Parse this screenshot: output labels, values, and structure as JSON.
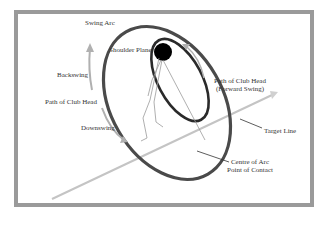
{
  "labels": {
    "swing_arc": "Swing Arc",
    "shoulder_plane": "Shoulder Plane",
    "backswing": "Backswing",
    "path_of_club_head": "Path of Club Head",
    "downswing": "Downswing",
    "path_forward_line1": "Path of Club Head",
    "path_forward_line2": "(Forward Swing)",
    "target_line": "Target Line",
    "centre_line1": "Centre of Arc",
    "centre_line2": "Point of Contact"
  },
  "colors": {
    "frame": "#9a9a9a",
    "arc": "#4a4a4a",
    "inner_ellipse": "#2a2a2a",
    "shoulder": "#000000",
    "arrows": "#b0b0b0",
    "target_line": "#c4c4c4",
    "figure": "#9a9a9a",
    "leader": "#333333"
  }
}
